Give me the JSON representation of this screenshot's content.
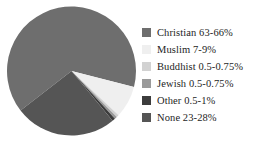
{
  "chart_data": {
    "type": "pie",
    "title": "",
    "subtitle": "",
    "xlabel": "",
    "ylabel": "",
    "legend_position": "right",
    "grid": false,
    "categories": [
      "Christian",
      "Muslim",
      "Buddhist",
      "Jewish",
      "Other",
      "None"
    ],
    "labels": [
      "Christian 63-66%",
      "Muslim 7-9%",
      "Buddhist 0.5-0.75%",
      "Jewish 0.5-0.75%",
      "Other 0.5-1%",
      "None 23-28%"
    ],
    "ranges": [
      "63-66%",
      "7-9%",
      "0.5-0.75%",
      "0.5-0.75%",
      "0.5-1%",
      "23-28%"
    ],
    "values": [
      64.5,
      8,
      0.625,
      0.625,
      0.75,
      25.5
    ],
    "colors": [
      "#6e6e6e",
      "#efefef",
      "#d2d2d2",
      "#9a9a9a",
      "#3c3c3c",
      "#555555"
    ],
    "slice_start_angles": [
      0,
      232.2,
      261,
      263.3,
      265.5,
      268.2
    ],
    "annotations": []
  },
  "legend": {
    "items": [
      {
        "label": "Christian 63-66%",
        "color": "#6e6e6e",
        "swatch_name": "legend-swatch-christian"
      },
      {
        "label": "Muslim 7-9%",
        "color": "#efefef",
        "swatch_name": "legend-swatch-muslim"
      },
      {
        "label": "Buddhist 0.5-0.75%",
        "color": "#d2d2d2",
        "swatch_name": "legend-swatch-buddhist"
      },
      {
        "label": "Jewish 0.5-0.75%",
        "color": "#9a9a9a",
        "swatch_name": "legend-swatch-jewish"
      },
      {
        "label": "Other 0.5-1%",
        "color": "#3c3c3c",
        "swatch_name": "legend-swatch-other"
      },
      {
        "label": "None 23-28%",
        "color": "#555555",
        "swatch_name": "legend-swatch-none"
      }
    ]
  }
}
